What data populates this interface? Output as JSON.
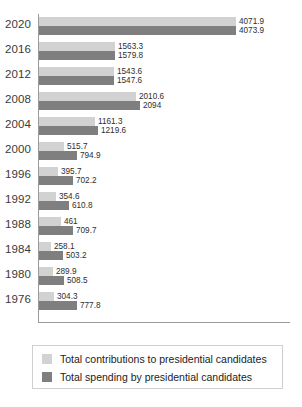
{
  "chart_data": {
    "type": "bar",
    "orientation": "horizontal",
    "title": "",
    "xlabel": "",
    "ylabel": "",
    "grid": false,
    "legend_position": "bottom",
    "xlim": [
      0,
      4200
    ],
    "categories": [
      "2020",
      "2016",
      "2012",
      "2008",
      "2004",
      "2000",
      "1996",
      "1992",
      "1988",
      "1984",
      "1980",
      "1976"
    ],
    "series": [
      {
        "name": "Total contributions to presidential candidates",
        "color": "#d2d2d2",
        "values": [
          4071.9,
          1563.3,
          1543.6,
          2010.6,
          1161.3,
          515.7,
          395.7,
          354.6,
          461,
          258.1,
          289.9,
          304.3
        ],
        "labels": [
          "4071.9",
          "1563.3",
          "1543.6",
          "2010.6",
          "1161.3",
          "515.7",
          "395.7",
          "354.6",
          "461",
          "258.1",
          "289.9",
          "304.3"
        ]
      },
      {
        "name": "Total spending by presidential candidates",
        "color": "#7f7f7f",
        "values": [
          4073.9,
          1579.8,
          1547.6,
          2094,
          1219.6,
          794.9,
          702.2,
          610.8,
          709.7,
          503.2,
          508.5,
          777.8
        ],
        "labels": [
          "4073.9",
          "1579.8",
          "1547.6",
          "2094",
          "1219.6",
          "794.9",
          "702.2",
          "610.8",
          "709.7",
          "503.2",
          "508.5",
          "777.8"
        ]
      }
    ]
  },
  "legend": {
    "items": [
      {
        "label": "Total contributions to presidential candidates",
        "color": "#d2d2d2"
      },
      {
        "label": "Total spending by presidential candidates",
        "color": "#7f7f7f"
      }
    ]
  },
  "colors": {
    "light_bar": "#d2d2d2",
    "dark_bar": "#7f7f7f",
    "axis": "#9a9a9a",
    "text": "#2e2e2e",
    "background": "#ffffff"
  }
}
